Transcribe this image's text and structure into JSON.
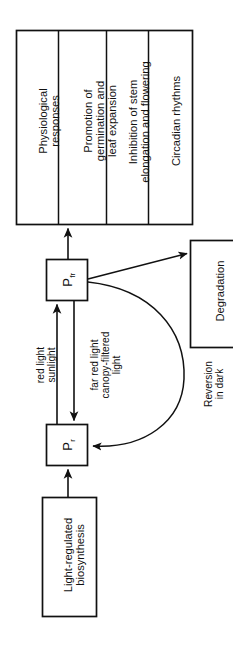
{
  "figure": {
    "orientation": "rotated-90-ccw",
    "line_color": "#111111",
    "background_color": "#ffffff"
  },
  "response_panel": {
    "name": "physiological responses panel",
    "cells": [
      {
        "id": "responses-header",
        "text": "Physiological\nresponses"
      },
      {
        "id": "promotion",
        "text": "Promotion of\ngermination and\nleaf expansion"
      },
      {
        "id": "inhibition",
        "text": "Inhibition of stem\nelongation and flowering"
      },
      {
        "id": "circadian",
        "text": "Circadian rhythms"
      }
    ]
  },
  "state_boxes": {
    "pfr": {
      "label": "P",
      "subscript": "fr"
    },
    "pr": {
      "label": "P",
      "subscript": "r"
    }
  },
  "process_boxes": {
    "degradation": {
      "text": "Degradation"
    },
    "biosynthesis": {
      "text": "Light-regulated\nbiosynthesis"
    }
  },
  "arrow_labels": {
    "red_light": "red light\nsunlight",
    "far_red_light": "far red light\ncanopy-filtered\nlight",
    "reversion": "Reversion\nin dark"
  }
}
